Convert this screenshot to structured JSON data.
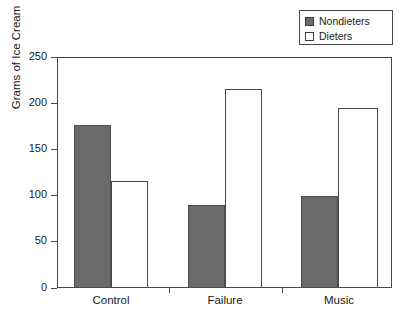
{
  "chart_data": {
    "type": "bar",
    "title": "",
    "xlabel": "",
    "ylabel": "Grams of Ice Cream",
    "categories": [
      "Control",
      "Failure",
      "Music"
    ],
    "series": [
      {
        "name": "Nondieters",
        "values": [
          176,
          90,
          100
        ],
        "color": "#6a6a6a",
        "swatch": "filled"
      },
      {
        "name": "Dieters",
        "values": [
          116,
          215,
          195
        ],
        "color": "#ffffff",
        "swatch": "hollow"
      }
    ],
    "ylim": [
      0,
      250
    ],
    "yticks": [
      0,
      50,
      100,
      150,
      200,
      250
    ],
    "ytick_labels": [
      "0",
      "50",
      "100",
      "150",
      "200",
      "250"
    ],
    "grid": false,
    "legend_position": "top-right",
    "legend_entries": [
      "Nondieters",
      "Dieters"
    ]
  },
  "legend": {
    "items": [
      {
        "label": "Nondieters",
        "swatch": "filled"
      },
      {
        "label": "Dieters",
        "swatch": "hollow"
      }
    ]
  },
  "axes": {
    "y_title": "Grams of Ice Cream",
    "y_labels": [
      "250",
      "200",
      "150",
      "100",
      "50",
      "0"
    ],
    "x_labels": [
      "Control",
      "Failure",
      "Music"
    ]
  }
}
